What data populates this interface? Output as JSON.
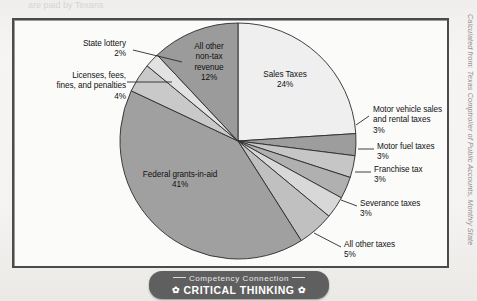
{
  "figure": {
    "frame_border_color": "#4b4b4b",
    "background_color": "#fbfbfa",
    "ghost_top_text": "are paid by Texans"
  },
  "credit": {
    "text": "Calculated from: Texas Comptroller of Public Accounts, Monthly State"
  },
  "banner": {
    "subtitle": "Competency Connection",
    "title": "CRITICAL THINKING",
    "ornament_left": "✿",
    "ornament_right": "✿",
    "background_color": "#5f5f5f"
  },
  "chart_data": {
    "type": "pie",
    "title": "",
    "subtitle": "",
    "xlabel": "",
    "ylabel": "",
    "legend_position": "callout-labels",
    "grid": false,
    "start_angle_deg": 0,
    "direction": "clockwise",
    "units": "percent",
    "total": 100,
    "categories": [
      "Sales Taxes",
      "Motor vehicle sales and rental taxes",
      "Motor fuel taxes",
      "Franchise tax",
      "Severance taxes",
      "All other taxes",
      "Federal grants-in-aid",
      "Licenses, fees, fines, and penalties",
      "State lottery",
      "All other non-tax revenue"
    ],
    "values": [
      24,
      3,
      3,
      3,
      3,
      5,
      41,
      4,
      2,
      12
    ],
    "colors": [
      "#efefef",
      "#9d9d9d",
      "#c6c6c6",
      "#b0b0b0",
      "#d8d8d8",
      "#c0c0c0",
      "#a0a0a0",
      "#c9c9c9",
      "#e2e2e2",
      "#9b9b9b"
    ],
    "slices": [
      {
        "label": "Sales Taxes",
        "value": 24,
        "value_label": "24%",
        "color": "#efefef",
        "label_placement": "inside"
      },
      {
        "label": "Motor vehicle sales and rental taxes",
        "value": 3,
        "value_label": "3%",
        "color": "#9d9d9d",
        "label_placement": "callout-right"
      },
      {
        "label": "Motor fuel taxes",
        "value": 3,
        "value_label": "3%",
        "color": "#c6c6c6",
        "label_placement": "callout-right"
      },
      {
        "label": "Franchise tax",
        "value": 3,
        "value_label": "3%",
        "color": "#b0b0b0",
        "label_placement": "callout-right"
      },
      {
        "label": "Severance taxes",
        "value": 3,
        "value_label": "3%",
        "color": "#d8d8d8",
        "label_placement": "callout-right"
      },
      {
        "label": "All other taxes",
        "value": 5,
        "value_label": "5%",
        "color": "#c0c0c0",
        "label_placement": "callout-right"
      },
      {
        "label": "Federal grants-in-aid",
        "value": 41,
        "value_label": "41%",
        "color": "#a0a0a0",
        "label_placement": "inside"
      },
      {
        "label": "Licenses, fees, fines, and penalties",
        "value": 4,
        "value_label": "4%",
        "color": "#c9c9c9",
        "label_placement": "callout-left"
      },
      {
        "label": "State lottery",
        "value": 2,
        "value_label": "2%",
        "color": "#e2e2e2",
        "label_placement": "callout-left"
      },
      {
        "label": "All other non-tax revenue",
        "value": 12,
        "value_label": "12%",
        "color": "#9b9b9b",
        "label_placement": "inside"
      }
    ]
  },
  "labels": {
    "sales_taxes": "Sales Taxes\n24%",
    "all_other_non_tax": "All other\nnon-tax\nrevenue\n12%",
    "federal_grants": "Federal grants-in-aid\n41%",
    "state_lottery": "State lottery\n2%",
    "licenses_fees": "Licenses, fees,\nfines, and penalties\n4%",
    "motor_vehicle": "Motor vehicle sales\nand rental taxes\n3%",
    "motor_fuel": "Motor fuel taxes\n3%",
    "franchise": "Franchise tax\n3%",
    "severance": "Severance taxes\n3%",
    "all_other_taxes": "All other taxes\n5%"
  }
}
